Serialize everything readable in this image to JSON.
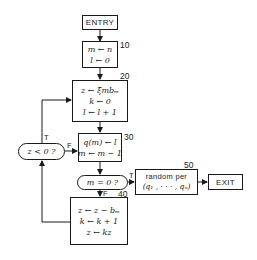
{
  "diagram": {
    "type": "flowchart",
    "nodes": {
      "entry": {
        "label": "ENTRY"
      },
      "step10": {
        "number": "10",
        "lines": [
          "m ← n",
          "l ← 0"
        ]
      },
      "step20": {
        "number": "20",
        "lines": [
          "z ← ξmbₘ",
          "k ← 0",
          "l ← l + 1"
        ]
      },
      "decision_z": {
        "label": "z < 0 ?",
        "true_label": "T",
        "false_label": "F"
      },
      "step30": {
        "number": "30",
        "lines": [
          "q(m) ← l",
          "m ← m − 1"
        ]
      },
      "decision_m": {
        "label": "m = 0 ?",
        "true_label": "T",
        "false_label": "F"
      },
      "step40": {
        "number": "40",
        "lines": [
          "z ← z − bₘ",
          "k ← k + 1",
          "z ← kz"
        ]
      },
      "step50": {
        "number": "50",
        "lines": [
          "random per",
          "(q₁ , · · · , qₙ)"
        ]
      },
      "exit": {
        "label": "EXIT"
      }
    },
    "edges": [
      {
        "from": "entry",
        "to": "step10"
      },
      {
        "from": "step10",
        "to": "step20"
      },
      {
        "from": "step20",
        "to": "step30"
      },
      {
        "from": "step30",
        "to": "decision_m"
      },
      {
        "from": "decision_m",
        "to": "step50",
        "label": "T"
      },
      {
        "from": "decision_m",
        "to": "step40",
        "label": "F"
      },
      {
        "from": "step40",
        "to": "decision_z"
      },
      {
        "from": "decision_z",
        "to": "step20",
        "label": "T"
      },
      {
        "from": "decision_z",
        "to": "step30",
        "label": "F"
      },
      {
        "from": "step50",
        "to": "exit"
      }
    ]
  }
}
